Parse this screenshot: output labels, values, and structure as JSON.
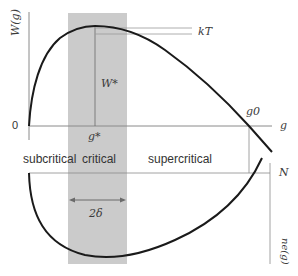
{
  "figure": {
    "y_axis_label": "W(g)",
    "x_axis_label": "g",
    "origin_label": "0",
    "peak_x_label": "g*",
    "peak_height_label": "W*",
    "kT_label": "kT",
    "root_label": "g0",
    "lower_axis_label": "N",
    "lower_y_axis_label": "ne(g)",
    "width_label": "2δ",
    "regions": {
      "subcritical": "subcritical",
      "critical": "critical",
      "supercritical": "supercritical"
    },
    "colors": {
      "band": "#c9c9c9",
      "curve": "#1a1a1a",
      "axes": "#8a8a8a",
      "text": "#333333"
    }
  }
}
